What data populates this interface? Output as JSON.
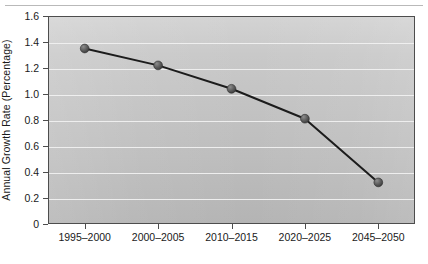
{
  "figure": {
    "background_color": "#ffffff",
    "plot_background_top": "#d3d3d3",
    "plot_background_bottom": "#b4b4b4",
    "frame_color": "#4d4d4d",
    "gridline_color": "#f0f0f0",
    "line_color": "#1c1c1c",
    "marker_color": "#5a5a5a"
  },
  "chart_data": {
    "type": "line",
    "title": "",
    "subtitle": "",
    "xlabel": "",
    "ylabel": "Annual Growth Rate (Percentage)",
    "categories": [
      "1995–2000",
      "2000–2005",
      "2010–2015",
      "2020–2025",
      "2045–2050"
    ],
    "values": [
      1.35,
      1.22,
      1.04,
      0.81,
      0.32
    ],
    "series": [
      {
        "name": "Annual Growth Rate",
        "values": [
          1.35,
          1.22,
          1.04,
          0.81,
          0.32
        ]
      }
    ],
    "ylim": [
      0,
      1.6
    ],
    "ytick_labels": [
      "0",
      "0.2",
      "0.4",
      "0.6",
      "0.8",
      "1.0",
      "1.2",
      "1.4",
      "1.6"
    ],
    "ytick_values": [
      0,
      0.2,
      0.4,
      0.6,
      0.8,
      1.0,
      1.2,
      1.4,
      1.6
    ],
    "xtick_labels": [
      "1995–2000",
      "2000–2005",
      "2010–2015",
      "2020–2025",
      "2045–2050"
    ],
    "grid": true,
    "grid_axis": "y",
    "legend": false,
    "legend_position": "none",
    "markers": "circle",
    "annotations": []
  }
}
